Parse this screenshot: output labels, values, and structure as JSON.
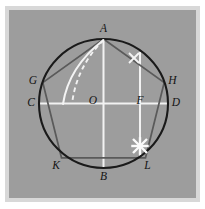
{
  "figure": {
    "kind": "geometric-diagram",
    "canvas": {
      "width": 205,
      "height": 209
    },
    "plate": {
      "x": 9,
      "y": 10,
      "width": 187,
      "height": 188,
      "fill": "#9d9d9d",
      "edge_fill": "#d8d8d8"
    },
    "circle": {
      "cx": 103.5,
      "cy": 103.5,
      "r": 64.5,
      "stroke": "#1a1a1a"
    },
    "pentagon": {
      "stroke": "#5a5a5a",
      "vertex_order": [
        "A",
        "H",
        "L",
        "K",
        "G"
      ]
    },
    "points": [
      {
        "id": "A",
        "label": "A",
        "x": 103.5,
        "y": 39.0,
        "label_x": 103.5,
        "label_y": 29.0
      },
      {
        "id": "G",
        "label": "G",
        "x": 42.8,
        "y": 82.5,
        "label_x": 33.0,
        "label_y": 81.0
      },
      {
        "id": "H",
        "label": "H",
        "x": 164.2,
        "y": 82.5,
        "label_x": 172.5,
        "label_y": 81.0
      },
      {
        "id": "C",
        "label": "C",
        "x": 39.0,
        "y": 103.5,
        "label_x": 31.0,
        "label_y": 103.0
      },
      {
        "id": "O",
        "label": "O",
        "x": 103.5,
        "y": 103.5,
        "label_x": 93.0,
        "label_y": 101.5
      },
      {
        "id": "F",
        "label": "F",
        "x": 140.0,
        "y": 103.5,
        "label_x": 140.0,
        "label_y": 101.5
      },
      {
        "id": "D",
        "label": "D",
        "x": 168.0,
        "y": 103.5,
        "label_x": 176.0,
        "label_y": 103.0
      },
      {
        "id": "K",
        "label": "K",
        "x": 61.5,
        "y": 157.8,
        "label_x": 56.0,
        "label_y": 166.0
      },
      {
        "id": "L",
        "label": "L",
        "x": 145.5,
        "y": 157.8,
        "label_x": 147.5,
        "label_y": 166.0
      },
      {
        "id": "B",
        "label": "B",
        "x": 103.5,
        "y": 168.0,
        "label_x": 103.5,
        "label_y": 177.0
      }
    ],
    "construction_lines": [
      {
        "id": "diameter-CD",
        "from": "C",
        "to": "D",
        "style": "white-solid"
      },
      {
        "id": "diameter-AB",
        "from": "A",
        "to": "B",
        "style": "white-solid"
      },
      {
        "id": "perpendicular-F",
        "from_x": 140.0,
        "from_y": 52.0,
        "to_x": 140.0,
        "to_y": 157.8,
        "style": "white-solid"
      }
    ],
    "arcs": [
      {
        "id": "arc-A-to-radius",
        "style": "white-solid",
        "from": "A",
        "to_x": 63.0,
        "to_y": 104.0
      },
      {
        "id": "arc-A-chord-dashed",
        "style": "white-dashed",
        "from": "A",
        "to_x": 72.0,
        "to_y": 104.0
      }
    ],
    "tick_marks": [
      {
        "id": "tick-upper-right",
        "x": 134.0,
        "y": 58.0,
        "size": 5.0,
        "weight": "normal"
      },
      {
        "id": "tick-lower-right",
        "x": 140.0,
        "y": 146.0,
        "size": 7.0,
        "weight": "bold"
      }
    ]
  }
}
